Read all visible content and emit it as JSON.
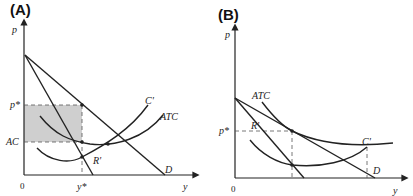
{
  "panels": [
    {
      "id": "A",
      "label": "(A)",
      "y_axis_label": "p",
      "x_axis_label": "y",
      "origin_label": "0",
      "price_label": "p*",
      "cost_label": "AC",
      "quantity_label": "y*",
      "curves": {
        "demand": "D",
        "marginal_revenue": "R'",
        "marginal_cost": "C'",
        "average_total_cost": "ATC"
      },
      "note": "Shaded profit rectangle between p* and AC up to y*"
    },
    {
      "id": "B",
      "label": "(B)",
      "y_axis_label": "p",
      "x_axis_label": "y",
      "origin_label": "0",
      "price_label": "p*",
      "curves": {
        "demand": "D",
        "marginal_revenue": "R'",
        "marginal_cost": "C'",
        "average_total_cost": "ATC"
      },
      "note": "ATC tangent to demand at p*, zero profit"
    }
  ],
  "colors": {
    "line": "#222222",
    "shade": "#cfcfcf",
    "dash": "#555555"
  }
}
